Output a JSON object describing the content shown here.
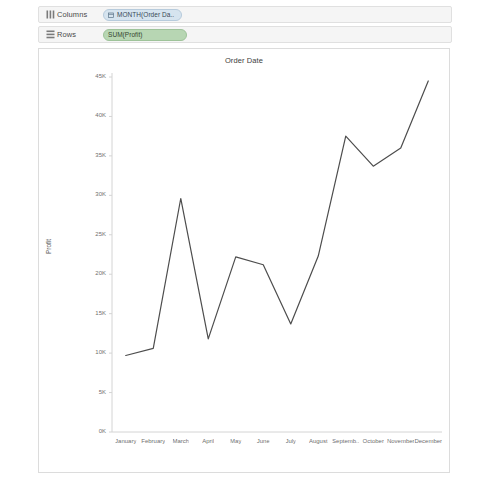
{
  "shelves": [
    {
      "key": "columns",
      "label": "Columns",
      "icon": "columns-icon",
      "pill": {
        "text": "MONTH(Order Da..",
        "icon": "calendar-icon",
        "kind": "blue"
      }
    },
    {
      "key": "rows",
      "label": "Rows",
      "icon": "rows-icon",
      "pill": {
        "text": "SUM(Profit)",
        "icon": "",
        "kind": "green"
      }
    }
  ],
  "viz": {
    "title": "Order Date",
    "line_color": "#4d4d4d"
  },
  "chart_data": {
    "type": "line",
    "title": "Order Date",
    "xlabel": "",
    "ylabel": "Profit",
    "categories": [
      "January",
      "February",
      "March",
      "April",
      "May",
      "June",
      "July",
      "August",
      "Septemb..",
      "October",
      "November",
      "December"
    ],
    "values": [
      9700,
      10600,
      29600,
      11800,
      22200,
      21200,
      13700,
      22300,
      37500,
      33700,
      36000,
      44500
    ],
    "ytick_labels": [
      "0K",
      "5K",
      "10K",
      "15K",
      "20K",
      "25K",
      "30K",
      "35K",
      "40K",
      "45K"
    ],
    "ytick_values": [
      0,
      5000,
      10000,
      15000,
      20000,
      25000,
      30000,
      35000,
      40000,
      45000
    ],
    "ylim": [
      0,
      45000
    ],
    "grid": false,
    "legend": "none",
    "series": [
      {
        "name": "SUM(Profit)",
        "values": [
          9700,
          10600,
          29600,
          11800,
          22200,
          21200,
          13700,
          22300,
          37500,
          33700,
          36000,
          44500
        ]
      }
    ]
  }
}
